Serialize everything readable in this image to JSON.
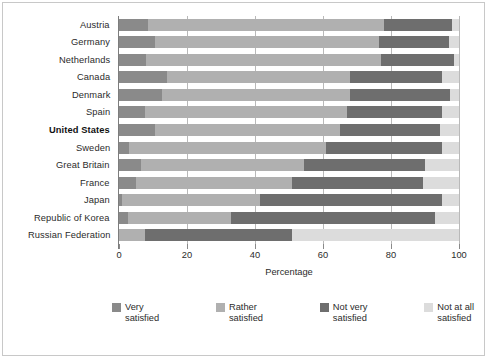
{
  "chart_data": {
    "type": "bar",
    "orientation": "horizontal",
    "stacked": true,
    "stack_mode": "percent",
    "title": "",
    "xlabel": "Percentage",
    "ylabel": "",
    "xlim": [
      0,
      100
    ],
    "xticks": [
      0,
      20,
      40,
      60,
      80,
      100
    ],
    "xtick_labels": [
      "0",
      "20",
      "40",
      "60",
      "80",
      "100"
    ],
    "grid": "vertical",
    "legend_position": "bottom",
    "highlight_category": "United States",
    "categories": [
      "Austria",
      "Germany",
      "Netherlands",
      "Canada",
      "Denmark",
      "Spain",
      "United States",
      "Sweden",
      "Great Britain",
      "France",
      "Japan",
      "Republic of Korea",
      "Russian Federation"
    ],
    "series": [
      {
        "name": "Very satisfied",
        "color": "#8a8a8a",
        "values": [
          8.5,
          10.5,
          8,
          14,
          12.5,
          7.5,
          10.5,
          3,
          6.5,
          5,
          1,
          2.5,
          0
        ]
      },
      {
        "name": "Rather satisfied",
        "color": "#b0b0b0",
        "values": [
          69.5,
          66,
          69,
          54,
          55.5,
          59.5,
          54.5,
          58,
          48,
          46,
          40.5,
          30.5,
          7.5
        ]
      },
      {
        "name": "Not very satisfied",
        "color": "#6e6e6e",
        "values": [
          20,
          20.5,
          21.5,
          27,
          29.5,
          28,
          29.5,
          34,
          35.5,
          38.5,
          53.5,
          60,
          43.5
        ]
      },
      {
        "name": "Not at all satisfied",
        "color": "#dcdcdc",
        "values": [
          2,
          3,
          1.5,
          5,
          2.5,
          5,
          5.5,
          5,
          10,
          10.5,
          5,
          7,
          49
        ]
      }
    ],
    "legend": [
      {
        "label_line1": "Very",
        "label_line2": "satisfied",
        "color": "#8a8a8a"
      },
      {
        "label_line1": "Rather",
        "label_line2": "satisfied",
        "color": "#b0b0b0"
      },
      {
        "label_line1": "Not very",
        "label_line2": "satisfied",
        "color": "#6e6e6e"
      },
      {
        "label_line1": "Not at all",
        "label_line2": "satisfied",
        "color": "#dcdcdc"
      }
    ],
    "colors": {
      "very_satisfied": "#8a8a8a",
      "rather_satisfied": "#b0b0b0",
      "not_very_satisfied": "#6e6e6e",
      "not_at_all_satisfied": "#dcdcdc",
      "gridline": "#b9b9b9",
      "axis": "#8a8a8a",
      "text": "#2b2b2b",
      "background": "#ffffff"
    }
  }
}
